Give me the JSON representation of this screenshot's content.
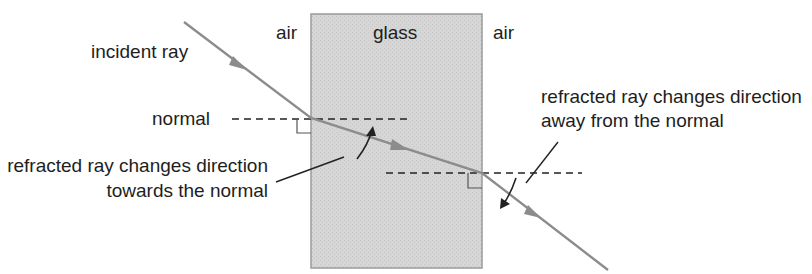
{
  "diagram": {
    "regions": {
      "left_medium": "air",
      "block_medium": "glass",
      "right_medium": "air"
    },
    "labels": {
      "incident_ray": "incident ray",
      "normal": "normal",
      "towards_line1": "refracted ray changes direction",
      "towards_line2": "towards the normal",
      "away_line1": "refracted ray changes direction",
      "away_line2": "away from the normal"
    },
    "colors": {
      "glass_fill": "#d4d4d4",
      "glass_border": "#9a9a9a",
      "ray": "#8c8c8c",
      "line": "#222222",
      "text": "#1e1e1e"
    }
  }
}
